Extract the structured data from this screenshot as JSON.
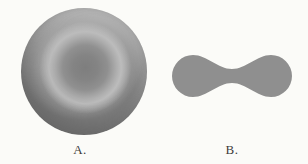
{
  "figure": {
    "background_color": "#fbfbf8",
    "label_color": "#3b3b3b",
    "panels": [
      {
        "label": "A.",
        "icon": "red-blood-cell-top-view-icon",
        "fill": "#9a9a9a"
      },
      {
        "label": "B.",
        "icon": "red-blood-cell-cross-section-icon",
        "fill": "#8f8f8f"
      }
    ]
  }
}
